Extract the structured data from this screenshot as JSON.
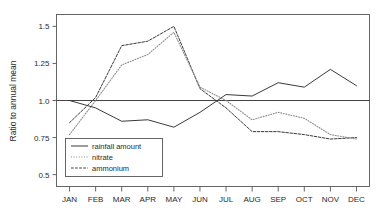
{
  "chart_data": {
    "type": "line",
    "title": "",
    "xlabel": "",
    "ylabel": "Ratio to annual mean",
    "categories": [
      "JAN",
      "FEB",
      "MAR",
      "APR",
      "MAY",
      "JUN",
      "JUL",
      "AUG",
      "SEP",
      "OCT",
      "NOV",
      "DEC"
    ],
    "ylim": [
      0.42,
      1.58
    ],
    "yticks": [
      0.5,
      0.75,
      1.0,
      1.25,
      1.5
    ],
    "ytick_labels": [
      "0.5",
      "0.75",
      "1.0",
      "1.25",
      "1.5"
    ],
    "grid": false,
    "reference_line": 1.0,
    "legend_position": "lower-left-inside",
    "series": [
      {
        "name": "rainfall amount",
        "style": "solid",
        "color": "#3a3a3a",
        "values": [
          1.0,
          0.95,
          0.86,
          0.87,
          0.82,
          0.92,
          1.04,
          1.03,
          1.12,
          1.09,
          1.21,
          1.1
        ]
      },
      {
        "name": "nitrate",
        "style": "dotted",
        "color": "#8c8c8c",
        "values": [
          0.77,
          1.0,
          1.24,
          1.31,
          1.46,
          1.09,
          1.0,
          0.87,
          0.92,
          0.88,
          0.77,
          0.74
        ]
      },
      {
        "name": "ammonium",
        "style": "dashed",
        "color": "#3a3a3a",
        "values": [
          0.85,
          1.02,
          1.37,
          1.4,
          1.5,
          1.08,
          0.95,
          0.79,
          0.79,
          0.77,
          0.74,
          0.75
        ]
      }
    ]
  },
  "legend": {
    "items": [
      {
        "label": "rainfall amount"
      },
      {
        "label": "nitrate"
      },
      {
        "label": "ammonium"
      }
    ]
  }
}
